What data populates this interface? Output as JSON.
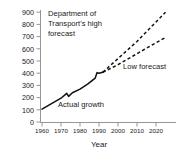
{
  "chart_data": {
    "type": "line",
    "title": "",
    "xlabel": "Year",
    "ylabel": "",
    "xlim": [
      1957,
      2027
    ],
    "ylim": [
      0,
      900
    ],
    "grid": false,
    "legend_position": "inline-annotations",
    "y_ticks": [
      900,
      800,
      700,
      600,
      500,
      400,
      300,
      200,
      100,
      0
    ],
    "x_ticks": [
      1960,
      1970,
      1980,
      1990,
      2000,
      2010,
      2020
    ],
    "series": [
      {
        "name": "Actual growth",
        "style": "solid",
        "x": [
          1960,
          1965,
          1970,
          1973,
          1974,
          1976,
          1980,
          1984,
          1988,
          1989,
          1990,
          1992
        ],
        "values": [
          105,
          150,
          195,
          235,
          210,
          240,
          270,
          310,
          360,
          405,
          400,
          408
        ]
      },
      {
        "name": "Department of Transport's high forecast",
        "style": "dashed",
        "x": [
          1992,
          2000,
          2010,
          2020,
          2025
        ],
        "values": [
          408,
          520,
          660,
          820,
          900
        ]
      },
      {
        "name": "Low forecast",
        "style": "dashed",
        "x": [
          1992,
          2000,
          2010,
          2020,
          2025
        ],
        "values": [
          408,
          470,
          560,
          650,
          692
        ]
      }
    ],
    "annotations": [
      {
        "name": "high-forecast-label",
        "lines": [
          "Department of",
          "Transport's high",
          "forecast"
        ],
        "x": 1967,
        "y": 880
      },
      {
        "name": "low-forecast-label",
        "lines": [
          "Low forecast"
        ],
        "x": 2004,
        "y": 495
      },
      {
        "name": "actual-growth-label",
        "lines": [
          "Actual growth"
        ],
        "x": 1974,
        "y": 150
      }
    ]
  },
  "axis": {
    "x_title": "Year"
  },
  "colors": {
    "line": "#111111",
    "axis": "#8a8a8a",
    "text": "#1a1a1a",
    "background": "#ffffff"
  }
}
